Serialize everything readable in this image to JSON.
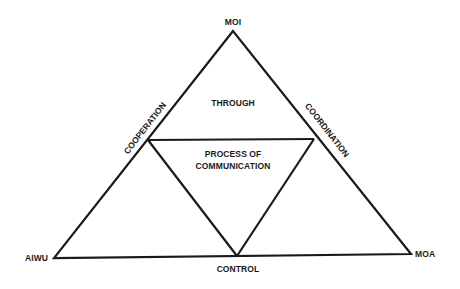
{
  "diagram": {
    "vertices": {
      "top": "MOI",
      "bottom_left": "AIWU",
      "bottom_right": "MOA"
    },
    "edges": {
      "left": "COOPERATION",
      "right": "COORDINATION",
      "bottom": "CONTROL"
    },
    "inner": {
      "top_region": "THROUGH",
      "center_line1": "PROCESS OF",
      "center_line2": "COMMUNICATION"
    },
    "colors": {
      "line": "#1a1a1a",
      "background": "#ffffff"
    }
  }
}
